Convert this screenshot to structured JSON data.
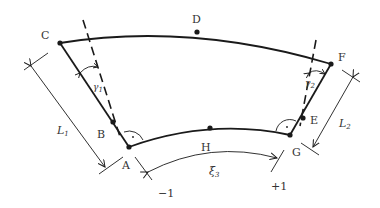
{
  "diagram": {
    "type": "curved-element-geometry",
    "colors": {
      "stroke": "#1a1a1a",
      "label": "#333333",
      "background": "#ffffff"
    },
    "points": [
      {
        "id": "A",
        "label": "A",
        "x": 129,
        "y": 147
      },
      {
        "id": "B",
        "label": "B",
        "x": 113,
        "y": 122
      },
      {
        "id": "C",
        "label": "C",
        "x": 60,
        "y": 43
      },
      {
        "id": "D",
        "label": "D",
        "x": 197,
        "y": 32
      },
      {
        "id": "E",
        "label": "E",
        "x": 303,
        "y": 118
      },
      {
        "id": "F",
        "label": "F",
        "x": 331,
        "y": 64
      },
      {
        "id": "G",
        "label": "G",
        "x": 290,
        "y": 135
      },
      {
        "id": "H",
        "label": "H",
        "x": 210,
        "y": 128
      }
    ],
    "dimensions": {
      "L1": {
        "label": "L",
        "sub": "1"
      },
      "L2": {
        "label": "L",
        "sub": "2"
      }
    },
    "angles": {
      "gamma1": {
        "label": "γ",
        "sub": "1"
      },
      "gamma2": {
        "label": "γ",
        "sub": "2"
      }
    },
    "coordinate": {
      "label": "ξ",
      "sub": "3",
      "start": "−1",
      "end": "+1"
    }
  }
}
